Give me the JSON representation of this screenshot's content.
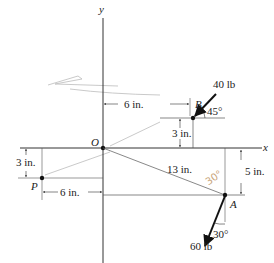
{
  "diagram": {
    "axes": {
      "x_label": "x",
      "y_label": "y",
      "origin_label": "O"
    },
    "points": {
      "B": {
        "label": "B"
      },
      "A": {
        "label": "A"
      },
      "P": {
        "label": "P"
      }
    },
    "forces": {
      "at_B": {
        "magnitude": "40 lb",
        "angle": "45°"
      },
      "at_A": {
        "magnitude": "60 lb",
        "angle": "30°"
      }
    },
    "dimensions": {
      "B_horizontal": "6 in.",
      "B_vertical": "3 in.",
      "P_vertical": "3 in.",
      "P_horizontal": "6 in.",
      "OA_length": "13 in.",
      "A_vertical": "5 in."
    },
    "handwritten_annotation": "30°",
    "colors": {
      "line": "#222222",
      "thin": "#555555",
      "hand": "#c9a57a",
      "scribble": "#bbbbbb"
    }
  }
}
